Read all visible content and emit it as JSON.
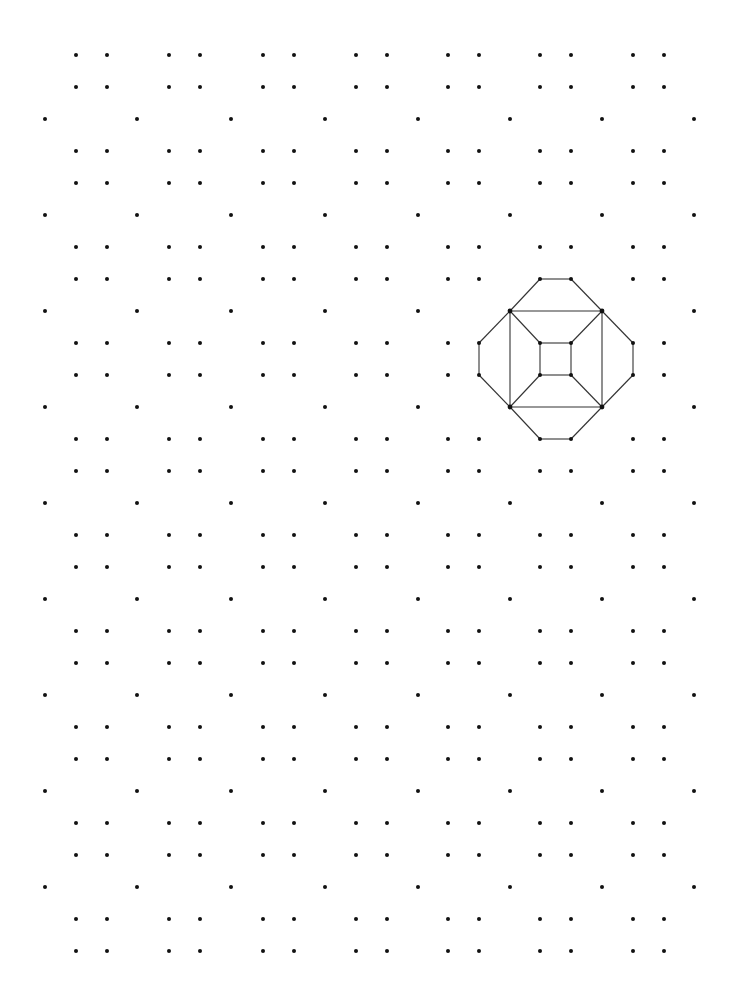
{
  "canvas": {
    "width": 739,
    "height": 1003,
    "background": "#ffffff"
  },
  "dot_grid": {
    "dot_color": "#111111",
    "dot_radius": 2,
    "single_columns_x": [
      45,
      137,
      231,
      325,
      418,
      510,
      602,
      694
    ],
    "single_rows_y": [
      119,
      215,
      311,
      407,
      503,
      599,
      695,
      791,
      887
    ],
    "pair_columns_x": [
      76,
      107,
      169,
      200,
      263,
      294,
      356,
      387,
      448,
      479,
      540,
      571,
      633,
      664
    ],
    "pair_rows_y": [
      55,
      87,
      151,
      183,
      247,
      279,
      343,
      375,
      439,
      471,
      535,
      567,
      631,
      663,
      727,
      759,
      823,
      855,
      919,
      951
    ]
  },
  "figure": {
    "name": "truncated-cube-projection",
    "edge_color": "#333333",
    "vertices": {
      "top_l": [
        540,
        279
      ],
      "top_r": [
        571,
        279
      ],
      "sq_tl": [
        510,
        311
      ],
      "sq_tr": [
        602,
        311
      ],
      "sq_bl": [
        510,
        407
      ],
      "sq_br": [
        602,
        407
      ],
      "left_t": [
        479,
        343
      ],
      "left_b": [
        479,
        375
      ],
      "right_t": [
        633,
        343
      ],
      "right_b": [
        633,
        375
      ],
      "in_tl": [
        540,
        343
      ],
      "in_tr": [
        571,
        343
      ],
      "in_bl": [
        540,
        375
      ],
      "in_br": [
        571,
        375
      ],
      "bot_l": [
        540,
        439
      ],
      "bot_r": [
        571,
        439
      ]
    },
    "edges": [
      [
        "top_l",
        "top_r"
      ],
      [
        "top_l",
        "sq_tl"
      ],
      [
        "top_r",
        "sq_tr"
      ],
      [
        "sq_tl",
        "sq_tr"
      ],
      [
        "sq_tr",
        "sq_br"
      ],
      [
        "sq_br",
        "sq_bl"
      ],
      [
        "sq_bl",
        "sq_tl"
      ],
      [
        "sq_tl",
        "left_t"
      ],
      [
        "left_t",
        "left_b"
      ],
      [
        "left_b",
        "sq_bl"
      ],
      [
        "sq_tr",
        "right_t"
      ],
      [
        "right_t",
        "right_b"
      ],
      [
        "right_b",
        "sq_br"
      ],
      [
        "sq_bl",
        "bot_l"
      ],
      [
        "bot_l",
        "bot_r"
      ],
      [
        "bot_r",
        "sq_br"
      ],
      [
        "in_tl",
        "in_tr"
      ],
      [
        "in_tr",
        "in_br"
      ],
      [
        "in_br",
        "in_bl"
      ],
      [
        "in_bl",
        "in_tl"
      ],
      [
        "sq_tl",
        "in_tl"
      ],
      [
        "sq_tr",
        "in_tr"
      ],
      [
        "sq_bl",
        "in_bl"
      ],
      [
        "sq_br",
        "in_br"
      ]
    ]
  }
}
